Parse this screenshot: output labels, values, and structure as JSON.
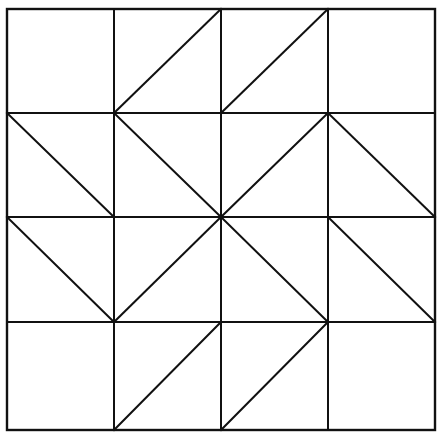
{
  "diagram": {
    "type": "quilt-block-pattern",
    "stroke_color": "#111111",
    "background_color": "#ffffff",
    "grid": {
      "rows": 4,
      "cols": 4,
      "x_lines": [
        7,
        114,
        221,
        328,
        435
      ],
      "y_lines": [
        9,
        113,
        217,
        322,
        430
      ]
    },
    "cells": [
      {
        "row": 0,
        "col": 0,
        "diagonal": "none"
      },
      {
        "row": 0,
        "col": 1,
        "diagonal": "bottom-left-to-top-right"
      },
      {
        "row": 0,
        "col": 2,
        "diagonal": "bottom-left-to-top-right"
      },
      {
        "row": 0,
        "col": 3,
        "diagonal": "none"
      },
      {
        "row": 1,
        "col": 0,
        "diagonal": "top-left-to-bottom-right"
      },
      {
        "row": 1,
        "col": 1,
        "diagonal": "top-left-to-bottom-right"
      },
      {
        "row": 1,
        "col": 2,
        "diagonal": "bottom-left-to-top-right"
      },
      {
        "row": 1,
        "col": 3,
        "diagonal": "top-left-to-bottom-right"
      },
      {
        "row": 2,
        "col": 0,
        "diagonal": "top-left-to-bottom-right"
      },
      {
        "row": 2,
        "col": 1,
        "diagonal": "bottom-left-to-top-right"
      },
      {
        "row": 2,
        "col": 2,
        "diagonal": "top-left-to-bottom-right"
      },
      {
        "row": 2,
        "col": 3,
        "diagonal": "top-left-to-bottom-right"
      },
      {
        "row": 3,
        "col": 0,
        "diagonal": "none"
      },
      {
        "row": 3,
        "col": 1,
        "diagonal": "bottom-left-to-top-right"
      },
      {
        "row": 3,
        "col": 2,
        "diagonal": "bottom-left-to-top-right"
      },
      {
        "row": 3,
        "col": 3,
        "diagonal": "none"
      }
    ]
  }
}
